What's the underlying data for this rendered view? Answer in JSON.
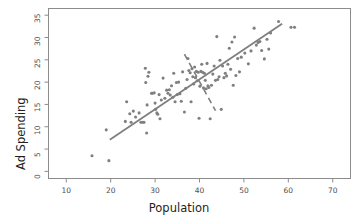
{
  "chart_data": {
    "type": "scatter",
    "title": "",
    "subtitle": "",
    "xlabel": "Population",
    "ylabel": "Ad Spending",
    "xlim": [
      6,
      74
    ],
    "ylim": [
      -1.6,
      36.5
    ],
    "xticks": [
      10,
      20,
      30,
      40,
      50,
      60,
      70
    ],
    "yticks": [
      0,
      5,
      10,
      15,
      20,
      25,
      30,
      35
    ],
    "xtick_labels": [
      "10",
      "20",
      "30",
      "40",
      "50",
      "60",
      "70"
    ],
    "ytick_labels": [
      "0",
      "5",
      "10",
      "15",
      "20",
      "25",
      "30",
      "35"
    ],
    "grid": false,
    "legend": null,
    "legend_position": "none",
    "point_color": "#7f7f7f",
    "point_size": 3.1,
    "line_color": "#7f7f7f",
    "series": [
      {
        "name": "observations",
        "marker": "circle",
        "color": "#7f7f7f",
        "points": [
          [
            15.8,
            3.5
          ],
          [
            19.6,
            2.4
          ],
          [
            19.0,
            9.3
          ],
          [
            23.3,
            11.2
          ],
          [
            23.6,
            15.6
          ],
          [
            24.3,
            12.9
          ],
          [
            24.6,
            11.0
          ],
          [
            25.1,
            13.5
          ],
          [
            25.6,
            12.2
          ],
          [
            26.4,
            13.1
          ],
          [
            26.8,
            11.0
          ],
          [
            27.2,
            11.0
          ],
          [
            27.5,
            11.0
          ],
          [
            27.8,
            23.1
          ],
          [
            27.9,
            19.9
          ],
          [
            28.1,
            8.6
          ],
          [
            28.2,
            14.9
          ],
          [
            28.4,
            21.3
          ],
          [
            28.6,
            22.2
          ],
          [
            29.2,
            17.5
          ],
          [
            29.4,
            17.5
          ],
          [
            29.8,
            17.6
          ],
          [
            30.0,
            15.3
          ],
          [
            30.1,
            13.9
          ],
          [
            30.4,
            13.1
          ],
          [
            30.6,
            12.8
          ],
          [
            30.9,
            17.2
          ],
          [
            31.1,
            11.8
          ],
          [
            31.4,
            16.0
          ],
          [
            31.8,
            20.9
          ],
          [
            32.2,
            16.4
          ],
          [
            32.6,
            18.2
          ],
          [
            32.9,
            17.5
          ],
          [
            33.2,
            18.3
          ],
          [
            33.4,
            17.1
          ],
          [
            33.7,
            19.2
          ],
          [
            34.0,
            16.6
          ],
          [
            34.2,
            22.0
          ],
          [
            34.5,
            15.6
          ],
          [
            34.8,
            19.9
          ],
          [
            35.0,
            17.2
          ],
          [
            35.3,
            20.0
          ],
          [
            35.6,
            17.4
          ],
          [
            35.9,
            15.7
          ],
          [
            36.2,
            22.3
          ],
          [
            36.6,
            13.3
          ],
          [
            36.9,
            18.6
          ],
          [
            37.2,
            20.6
          ],
          [
            37.4,
            25.3
          ],
          [
            37.6,
            22.6
          ],
          [
            37.9,
            22.1
          ],
          [
            38.1,
            15.6
          ],
          [
            38.3,
            23.0
          ],
          [
            38.5,
            21.2
          ],
          [
            38.7,
            19.6
          ],
          [
            38.9,
            23.4
          ],
          [
            39.1,
            21.0
          ],
          [
            39.3,
            22.4
          ],
          [
            39.5,
            20.3
          ],
          [
            39.7,
            22.2
          ],
          [
            39.9,
            11.9
          ],
          [
            40.1,
            19.1
          ],
          [
            40.3,
            22.4
          ],
          [
            40.5,
            24.0
          ],
          [
            40.7,
            22.2
          ],
          [
            40.9,
            18.7
          ],
          [
            41.1,
            22.0
          ],
          [
            41.3,
            20.4
          ],
          [
            41.5,
            18.5
          ],
          [
            41.7,
            24.2
          ],
          [
            41.9,
            19.2
          ],
          [
            42.1,
            18.8
          ],
          [
            42.4,
            11.8
          ],
          [
            42.7,
            19.3
          ],
          [
            43.0,
            21.8
          ],
          [
            43.3,
            23.6
          ],
          [
            43.6,
            20.4
          ],
          [
            43.9,
            30.2
          ],
          [
            44.1,
            20.6
          ],
          [
            44.4,
            21.2
          ],
          [
            44.6,
            24.9
          ],
          [
            44.9,
            13.9
          ],
          [
            45.2,
            23.6
          ],
          [
            45.5,
            21.0
          ],
          [
            45.8,
            22.0
          ],
          [
            46.1,
            21.4
          ],
          [
            46.4,
            24.0
          ],
          [
            46.7,
            27.6
          ],
          [
            47.0,
            22.9
          ],
          [
            47.3,
            29.0
          ],
          [
            47.6,
            19.3
          ],
          [
            47.9,
            30.1
          ],
          [
            48.2,
            21.5
          ],
          [
            48.6,
            25.3
          ],
          [
            49.0,
            22.3
          ],
          [
            49.4,
            25.6
          ],
          [
            50.2,
            26.5
          ],
          [
            51.0,
            24.1
          ],
          [
            51.6,
            27.0
          ],
          [
            52.3,
            32.1
          ],
          [
            52.8,
            28.3
          ],
          [
            53.2,
            28.9
          ],
          [
            53.6,
            29.1
          ],
          [
            54.0,
            27.1
          ],
          [
            54.6,
            25.2
          ],
          [
            55.2,
            29.6
          ],
          [
            55.6,
            27.4
          ],
          [
            56.0,
            31.0
          ],
          [
            57.8,
            33.6
          ],
          [
            60.6,
            32.3
          ],
          [
            61.4,
            32.3
          ]
        ]
      }
    ],
    "annotations": [
      {
        "name": "regression-line",
        "style": "solid",
        "color": "#7f7f7f",
        "x1": 19.8,
        "y1": 7.1,
        "x2": 58.6,
        "y2": 33.1
      },
      {
        "name": "dashed-reference-line",
        "style": "dashed",
        "color": "#7f7f7f",
        "x1": 36.6,
        "y1": 26.3,
        "x2": 43.6,
        "y2": 13.6
      }
    ]
  }
}
